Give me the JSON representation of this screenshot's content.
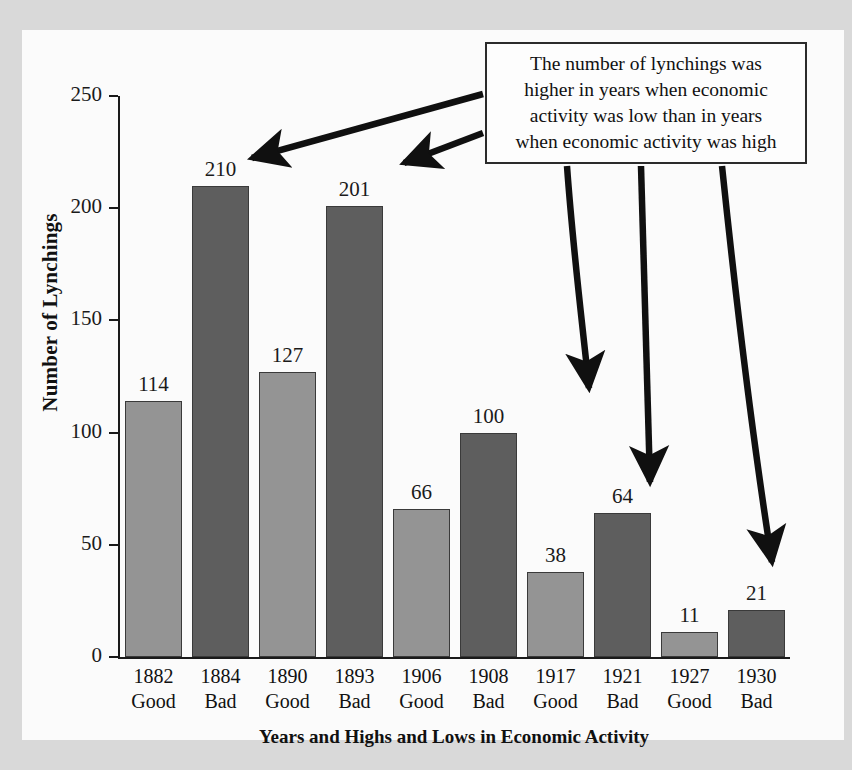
{
  "chart_data": {
    "type": "bar",
    "title": "",
    "xlabel": "Years and Highs and Lows in Economic Activity",
    "ylabel": "Number of Lynchings",
    "ylim": [
      0,
      250
    ],
    "yticks": [
      0,
      50,
      100,
      150,
      200,
      250
    ],
    "grid": false,
    "legend": "none",
    "categories": [
      "1882 Good",
      "1884 Bad",
      "1890 Good",
      "1893 Bad",
      "1906 Good",
      "1908 Bad",
      "1917 Good",
      "1921 Bad",
      "1927 Good",
      "1930 Bad"
    ],
    "values": [
      114,
      210,
      127,
      201,
      66,
      100,
      38,
      64,
      11,
      21
    ],
    "bars": [
      {
        "year": "1882",
        "status": "Good",
        "value": 114,
        "value_label": "114",
        "kind": "good"
      },
      {
        "year": "1884",
        "status": "Bad",
        "value": 210,
        "value_label": "210",
        "kind": "bad"
      },
      {
        "year": "1890",
        "status": "Good",
        "value": 127,
        "value_label": "127",
        "kind": "good"
      },
      {
        "year": "1893",
        "status": "Bad",
        "value": 201,
        "value_label": "201",
        "kind": "bad"
      },
      {
        "year": "1906",
        "status": "Good",
        "value": 66,
        "value_label": "66",
        "kind": "good"
      },
      {
        "year": "1908",
        "status": "Bad",
        "value": 100,
        "value_label": "100",
        "kind": "bad"
      },
      {
        "year": "1917",
        "status": "Good",
        "value": 38,
        "value_label": "38",
        "kind": "good"
      },
      {
        "year": "1921",
        "status": "Bad",
        "value": 64,
        "value_label": "64",
        "kind": "bad"
      },
      {
        "year": "1927",
        "status": "Good",
        "value": 11,
        "value_label": "11",
        "kind": "good"
      },
      {
        "year": "1930",
        "status": "Bad",
        "value": 21,
        "value_label": "21",
        "kind": "bad"
      }
    ],
    "annotation": {
      "lines": [
        "The number of lynchings was",
        "higher in years when economic",
        "activity was low than in years",
        "when economic activity was high"
      ],
      "text": "The number of lynchings was higher in years when economic activity was low than in years when economic activity was high",
      "arrow_targets": [
        "210",
        "201",
        "100",
        "64",
        "21"
      ]
    },
    "colors": {
      "good_bar": "#949494",
      "bad_bar": "#5e5e5e",
      "axis": "#1a1a1a",
      "annotation_border": "#2b2b2b",
      "page_background": "#d9d9d9",
      "paper": "#fbfbfb"
    }
  },
  "axis": {
    "y_title": "Number of Lynchings",
    "x_title": "Years and Highs and Lows in Economic Activity",
    "y_ticks": [
      "250",
      "200",
      "150",
      "100",
      "50",
      "0"
    ]
  }
}
